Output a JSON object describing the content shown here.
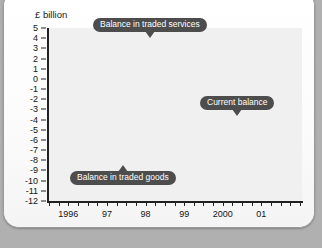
{
  "chart_data": {
    "type": "line",
    "title": "",
    "ylabel": "£ billion",
    "xlabel": "",
    "ylim": [
      -12,
      5
    ],
    "yticks": [
      5,
      4,
      3,
      2,
      1,
      0,
      -1,
      -2,
      -3,
      -4,
      -5,
      -6,
      -7,
      -8,
      -9,
      -10,
      -11,
      -12
    ],
    "ytick_labels": [
      "5",
      "4",
      "3",
      "2",
      "1",
      "0",
      "-1",
      "-2",
      "-3",
      "-4",
      "-5",
      "-6",
      "-7",
      "-8",
      "-9",
      "-10",
      "-11",
      "-12"
    ],
    "xtick_labels": [
      "1996",
      "97",
      "98",
      "99",
      "2000",
      "01"
    ],
    "x_period": "quarterly",
    "grid": true,
    "zero_line": true,
    "legend": "annotations",
    "series": [
      {
        "name": "Balance in traded services",
        "color": "#3c3c3c",
        "values": [
          2.55,
          2.75,
          2.9,
          3.0,
          3.15,
          3.3,
          3.45,
          3.6,
          3.6,
          3.45,
          3.5,
          3.75,
          3.8,
          3.75,
          3.95,
          4.0,
          3.8,
          3.85,
          3.9,
          3.9,
          3.75,
          3.55,
          3.15,
          3.1,
          3.35,
          3.5,
          3.6,
          3.8,
          4.35,
          4.8,
          4.6,
          1.55,
          4.4
        ]
      },
      {
        "name": "Current balance",
        "color": "#3c3c3c",
        "values": [
          -2.3,
          -1.95,
          -2.1,
          -1.8,
          -1.6,
          -1.15,
          -0.35,
          0.2,
          0.7,
          0.7,
          0.7,
          -2.2,
          -1.7,
          -1.15,
          1.4,
          -2.3,
          -6.5,
          -5.5,
          -4.8,
          -5.1,
          -4.2,
          -4.35,
          -6.1,
          -4.9,
          -5.2,
          -5.3,
          -6.0,
          -6.2,
          -8.6,
          -6.1,
          -4.0,
          -6.1,
          -5.35,
          -5.9
        ]
      },
      {
        "name": "Balance in traded goods",
        "color": "#5a5a5a",
        "values": [
          -3.95,
          -3.6,
          -3.3,
          -3.2,
          -2.95,
          -2.6,
          -2.2,
          -2.55,
          -2.7,
          -2.65,
          -3.1,
          -3.05,
          -3.25,
          -3.55,
          -4.2,
          -4.65,
          -5.2,
          -6.1,
          -6.5,
          -8.05,
          -6.9,
          -6.6,
          -6.85,
          -7.2,
          -7.15,
          -7.5,
          -7.75,
          -7.7,
          -8.25,
          -8.25,
          -9.15,
          -9.2,
          -11.05,
          -10.5,
          -10.4
        ]
      }
    ],
    "annotations": [
      {
        "label": "Balance in traded services",
        "pointer": "down"
      },
      {
        "label": "Current balance",
        "pointer": "down"
      },
      {
        "label": "Balance in traded goods",
        "pointer": "up"
      }
    ],
    "colors": {
      "grid": "#c9c9c9",
      "plot_bg": "#f0f0f0",
      "axis": "#202020",
      "callout_bg": "#4d4d4d",
      "callout_text": "#ffffff"
    }
  }
}
